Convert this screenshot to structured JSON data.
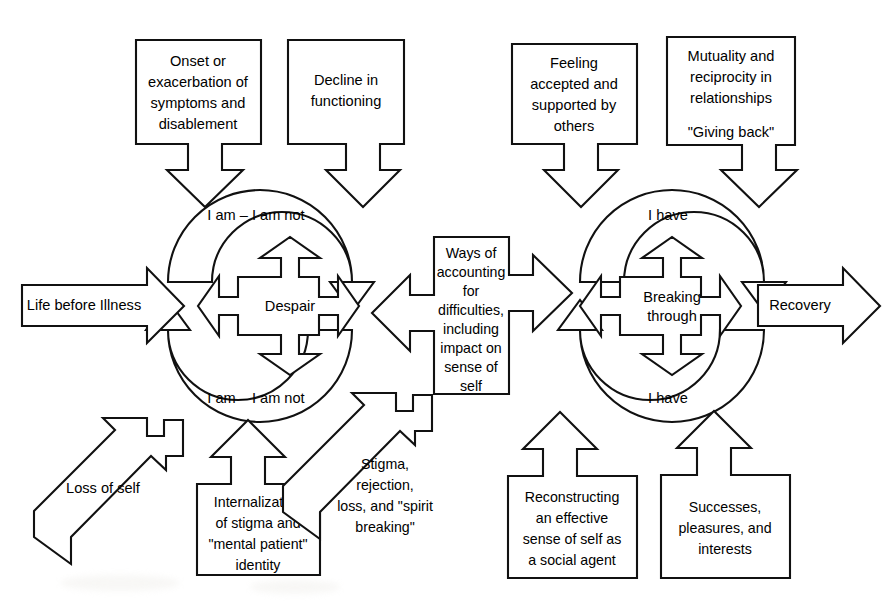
{
  "diagram": {
    "background_color": "#ffffff",
    "line_color": "#111111",
    "text_color": "#000000"
  },
  "flow_arrows": {
    "entry": "Life before Illness",
    "exit": "Recovery"
  },
  "top_boxes": [
    {
      "id": "onset",
      "lines": [
        "Onset or",
        "exacerbation of",
        "symptoms and",
        "disablement"
      ]
    },
    {
      "id": "decline",
      "lines": [
        "Decline in",
        "functioning"
      ]
    },
    {
      "id": "accepted",
      "lines": [
        "Feeling",
        "accepted and",
        "supported by",
        "others"
      ]
    },
    {
      "id": "mutuality",
      "lines": [
        "Mutuality and",
        "reciprocity in",
        "relationships",
        "",
        "\"Giving back\""
      ]
    }
  ],
  "bottom_boxes": [
    {
      "id": "internalization",
      "lines": [
        "Internalization",
        "of stigma and",
        "\"mental patient\"",
        "identity"
      ]
    },
    {
      "id": "reconstructing",
      "lines": [
        "Reconstructing",
        "an effective",
        "sense of self as",
        "a social agent"
      ]
    },
    {
      "id": "successes",
      "lines": [
        "Successes,",
        "pleasures, and",
        "interests"
      ]
    }
  ],
  "diagonal_shapes": [
    {
      "id": "loss-of-self",
      "lines": [
        "Loss of self"
      ]
    },
    {
      "id": "stigma",
      "lines": [
        "Stigma,",
        "rejection,",
        "loss, and \"spirit",
        "breaking\""
      ]
    }
  ],
  "center_box": {
    "id": "ways-of-accounting",
    "lines": [
      "Ways of",
      "accounting",
      "for",
      "difficulties,",
      "including",
      "impact on",
      "sense of",
      "self"
    ]
  },
  "left_cluster": {
    "core_lines": [
      "Despair"
    ],
    "upper_loop_label": "I am – I am not",
    "lower_loop_label": "I am – I am not"
  },
  "right_cluster": {
    "core_lines": [
      "Breaking",
      "through"
    ],
    "upper_loop_label": "I have",
    "lower_loop_label": "I have"
  }
}
